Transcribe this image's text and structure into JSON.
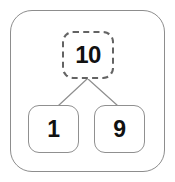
{
  "diagram": {
    "type": "number-bond",
    "whole": {
      "value": "10",
      "border_style": "dashed",
      "border_color": "#636363"
    },
    "parts": [
      {
        "value": "1",
        "border_style": "solid",
        "border_color": "#909090"
      },
      {
        "value": "9",
        "border_style": "solid",
        "border_color": "#909090"
      }
    ],
    "connectors": [
      {
        "name": "whole-to-left-part",
        "color": "#8f8f8f"
      },
      {
        "name": "whole-to-right-part",
        "color": "#8f8f8f"
      }
    ],
    "frame": {
      "border_color": "#8d8d8d",
      "background": "#ffffff"
    }
  }
}
